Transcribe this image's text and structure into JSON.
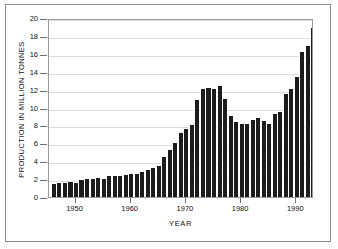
{
  "chart_data": {
    "type": "bar",
    "title": "",
    "xlabel": "YEAR",
    "ylabel": "PRODUCTION IN MILLION TONNES",
    "xlim": [
      1945.2,
      1993.2
    ],
    "ylim": [
      0,
      20
    ],
    "yticks": [
      0,
      2,
      4,
      6,
      8,
      10,
      12,
      14,
      16,
      18,
      20
    ],
    "ytick_labels": [
      "0",
      "2",
      "4",
      "6",
      "8",
      "10",
      "12",
      "14",
      "16",
      "18",
      "20"
    ],
    "xticks": [
      1950,
      1960,
      1970,
      1980,
      1990
    ],
    "xtick_labels": [
      "1950",
      "1960",
      "1970",
      "1980",
      "1990"
    ],
    "grid": "horizontal",
    "legend": "none",
    "bar_color": "#1c1c1c",
    "categories": [
      "1946",
      "1947",
      "1948",
      "1949",
      "1950",
      "1951",
      "1952",
      "1953",
      "1954",
      "1955",
      "1956",
      "1957",
      "1958",
      "1959",
      "1960",
      "1961",
      "1962",
      "1963",
      "1964",
      "1965",
      "1966",
      "1967",
      "1968",
      "1969",
      "1970",
      "1971",
      "1972",
      "1973",
      "1974",
      "1975",
      "1976",
      "1977",
      "1978",
      "1979",
      "1980",
      "1981",
      "1982",
      "1983",
      "1984",
      "1985",
      "1986",
      "1987",
      "1988",
      "1989",
      "1990",
      "1991",
      "1992"
    ],
    "values": [
      1.5,
      1.6,
      1.6,
      1.7,
      1.6,
      1.9,
      2.0,
      2.0,
      2.1,
      2.0,
      2.3,
      2.3,
      2.3,
      2.5,
      2.6,
      2.6,
      2.8,
      3.0,
      3.2,
      3.5,
      4.5,
      5.2,
      6.0,
      7.1,
      7.6,
      8.1,
      10.8,
      12.1,
      12.2,
      12.1,
      12.4,
      11.0,
      9.1,
      8.4,
      8.2,
      8.2,
      8.6,
      8.8,
      8.5,
      8.2,
      9.3,
      9.5,
      11.5,
      12.1,
      13.4,
      16.2,
      16.9
    ],
    "values_tail": [
      18.9,
      15.9,
      13.0,
      12.8
    ],
    "units": "million tonnes",
    "n_bars": 47
  }
}
